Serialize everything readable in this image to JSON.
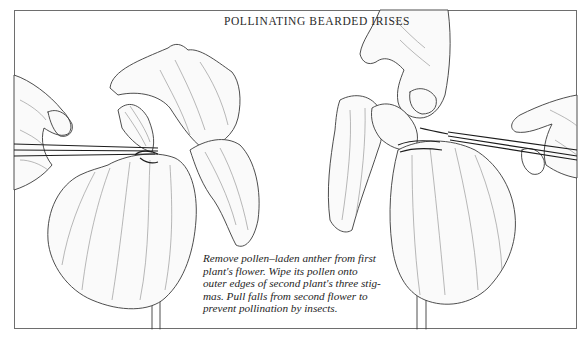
{
  "figure": {
    "title": "POLLINATING BEARDED IRISES",
    "caption_lines": [
      "Remove pollen–laden anther from first",
      "plant's flower. Wipe its pollen onto",
      "outer edges of second plant's three stig-",
      "mas. Pull falls from second flower to",
      "prevent pollination by insects."
    ],
    "illustrations": [
      {
        "label": "left-iris-with-tweezers",
        "subject": "hand holding tweezers removing anther from first iris flower"
      },
      {
        "label": "right-iris-with-tweezers",
        "subject": "hands holding tweezers applying pollen to second iris stigmas"
      }
    ],
    "colors": {
      "ink": "#3a3a3a",
      "paper": "#ffffff",
      "frame": "#6e6e6e"
    }
  }
}
